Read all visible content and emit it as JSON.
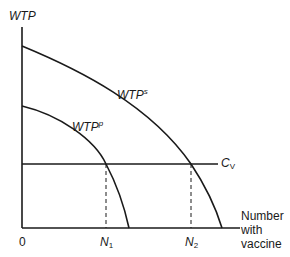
{
  "diagram": {
    "y_axis_label": "WTP",
    "x_axis_label_lines": [
      "Number",
      "with",
      "vaccine"
    ],
    "origin_label": "0",
    "curves": [
      {
        "name": "WTP",
        "superscript": "s",
        "description": "social willingness to pay"
      },
      {
        "name": "WTP",
        "superscript": "p",
        "description": "private willingness to pay"
      }
    ],
    "cost_line": {
      "name": "C",
      "subscript": "V"
    },
    "markers": [
      {
        "name": "N",
        "subscript": "1"
      },
      {
        "name": "N",
        "subscript": "2"
      }
    ],
    "colors": {
      "line": "#1a1a1a",
      "background": "#ffffff"
    }
  }
}
